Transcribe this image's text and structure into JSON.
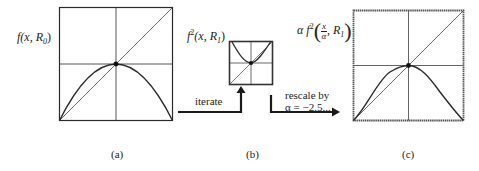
{
  "figure": {
    "panels": [
      {
        "id": "a",
        "caption": "(a)",
        "function_label": {
          "prefix": "f",
          "args": "(x, R",
          "subscript": "0",
          "close": ")"
        },
        "curve": "parabola"
      },
      {
        "id": "b",
        "caption": "(b)",
        "function_label": {
          "prefix": "f",
          "superscript": "2",
          "args": "(x, R",
          "subscript": "1",
          "close": ")"
        },
        "curve": "second-iterate"
      },
      {
        "id": "c",
        "caption": "(c)",
        "function_label": {
          "alpha": "α",
          "prefix": "f",
          "superscript": "2",
          "frac_num": "x",
          "frac_den": "α",
          "tail": ", R",
          "subscript": "1"
        },
        "curve": "rescaled-second-iterate"
      }
    ],
    "arrows": [
      {
        "id": "iterate",
        "label": "iterate"
      },
      {
        "id": "rescale",
        "label_line1": "rescale by",
        "label_line2": "α = −2.5..."
      }
    ],
    "colors": {
      "line": "#2a2a2a",
      "grid": "#555555",
      "background": "#ffffff"
    }
  }
}
